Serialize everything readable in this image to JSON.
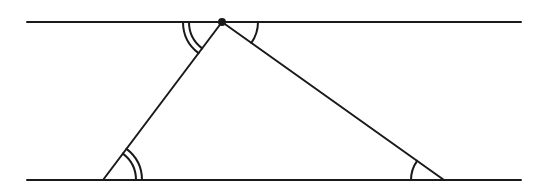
{
  "diagram": {
    "type": "geometry",
    "stroke_color": "#1a1a1a",
    "background": "#ffffff",
    "parallel_lines": [
      {
        "name": "top-line",
        "x1": 27,
        "y1": 22,
        "x2": 521,
        "y2": 22
      },
      {
        "name": "bottom-line",
        "x1": 27,
        "y1": 180,
        "x2": 521,
        "y2": 180
      }
    ],
    "vertices": {
      "apex": {
        "x": 222,
        "y": 22,
        "marked_point": true
      },
      "bottom_left": {
        "x": 103,
        "y": 180
      },
      "bottom_right": {
        "x": 444,
        "y": 180
      }
    },
    "angle_marks": [
      {
        "name": "apex-left-double-arc",
        "vertex": "apex",
        "arcs": 2,
        "equal_to": "bottom-left-double-arc"
      },
      {
        "name": "apex-right-single-arc",
        "vertex": "apex",
        "arcs": 1,
        "equal_to": "bottom-right-single-arc"
      },
      {
        "name": "bottom-left-double-arc",
        "vertex": "bottom_left",
        "arcs": 2
      },
      {
        "name": "bottom-right-single-arc",
        "vertex": "bottom_right",
        "arcs": 1
      }
    ]
  }
}
